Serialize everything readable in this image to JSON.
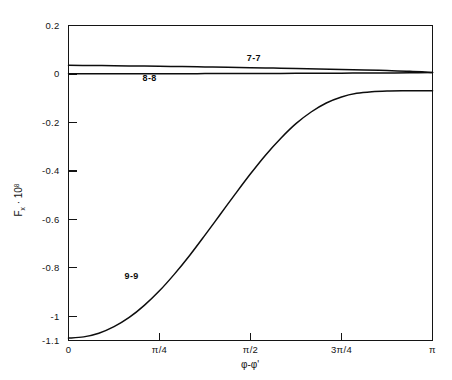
{
  "chart_data": {
    "type": "line",
    "title": "",
    "xlabel": "φ-φ'",
    "ylabel_base": "F",
    "ylabel_sub": "x",
    "ylabel_mid": " · 10",
    "ylabel_sup": "8",
    "ylabel": "F_x · 10^8",
    "xlim": [
      0,
      3.14159
    ],
    "ylim": [
      -1.1,
      0.2
    ],
    "grid": false,
    "legend_position": "inline-curve-labels",
    "xticks": [
      0,
      0.7854,
      1.5708,
      2.3562,
      3.14159
    ],
    "xticklabels": [
      "0",
      "π/4",
      "π/2",
      "3π/4",
      "π"
    ],
    "yticks": [
      0.2,
      0,
      -0.2,
      -0.4,
      -0.6,
      -0.8,
      -1,
      -1.1
    ],
    "yticklabels": [
      "0.2",
      "0",
      "-0.2",
      "-0.4",
      "-0.6",
      "-0.8",
      "-1",
      "-1.1"
    ],
    "series": [
      {
        "name": "7-7",
        "label": "7-7",
        "label_x": 1.6,
        "label_y": 0.055,
        "x": [
          0,
          0.196,
          0.393,
          0.589,
          0.785,
          0.982,
          1.178,
          1.374,
          1.571,
          1.767,
          1.963,
          2.16,
          2.356,
          2.553,
          2.749,
          2.945,
          3.142
        ],
        "y": [
          0.0355,
          0.0348,
          0.034,
          0.033,
          0.0318,
          0.0305,
          0.0291,
          0.0276,
          0.026,
          0.0243,
          0.0225,
          0.0206,
          0.0186,
          0.0164,
          0.014,
          0.011,
          0.006
        ]
      },
      {
        "name": "8-8",
        "label": "8-8",
        "label_x": 0.7,
        "label_y": -0.031,
        "x": [
          0,
          0.196,
          0.393,
          0.589,
          0.785,
          0.982,
          1.178,
          1.374,
          1.571,
          1.767,
          1.963,
          2.16,
          2.356,
          2.553,
          2.749,
          2.945,
          3.142
        ],
        "y": [
          0.0005,
          0.0006,
          0.0007,
          0.0008,
          0.001,
          0.0012,
          0.0014,
          0.0017,
          0.002,
          0.0023,
          0.0026,
          0.003,
          0.0034,
          0.0038,
          0.0043,
          0.0049,
          0.0056
        ]
      },
      {
        "name": "9-9",
        "label": "9-9",
        "label_x": 0.545,
        "label_y": -0.845,
        "x": [
          0,
          0.131,
          0.262,
          0.393,
          0.524,
          0.654,
          0.785,
          0.916,
          1.047,
          1.178,
          1.309,
          1.44,
          1.571,
          1.702,
          1.833,
          1.963,
          2.094,
          2.225,
          2.356,
          2.487,
          2.618,
          2.749,
          2.88,
          3.011,
          3.142
        ],
        "y": [
          -1.09,
          -1.085,
          -1.07,
          -1.043,
          -1.005,
          -0.955,
          -0.895,
          -0.825,
          -0.748,
          -0.665,
          -0.58,
          -0.495,
          -0.412,
          -0.334,
          -0.265,
          -0.205,
          -0.157,
          -0.12,
          -0.095,
          -0.08,
          -0.073,
          -0.07,
          -0.069,
          -0.069,
          -0.069
        ]
      }
    ]
  }
}
